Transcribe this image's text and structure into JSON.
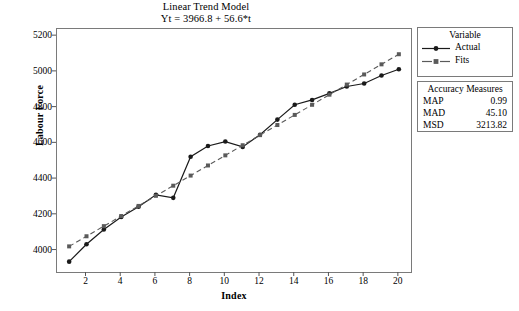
{
  "chart_data": {
    "type": "line",
    "title": "Linear Trend Model",
    "subtitle": "Yt = 3966.8 + 56.6*t",
    "xlabel": "Index",
    "ylabel": "Labour Force",
    "xlim": [
      0.3,
      20.7
    ],
    "ylim": [
      3880,
      5240
    ],
    "xticks": [
      2,
      4,
      6,
      8,
      10,
      12,
      14,
      16,
      18,
      20
    ],
    "yticks": [
      4000,
      4200,
      4400,
      4600,
      4800,
      5000,
      5200
    ],
    "grid": false,
    "legend_position": "right",
    "legend_title": "Variable",
    "x": [
      1,
      2,
      3,
      4,
      5,
      6,
      7,
      8,
      9,
      10,
      11,
      12,
      13,
      14,
      15,
      16,
      17,
      18,
      19,
      20
    ],
    "series": [
      {
        "name": "Actual",
        "style": "solid",
        "marker": "circle",
        "color": "#1a1a1a",
        "values": [
          3938,
          4035,
          4118,
          4188,
          4245,
          4312,
          4295,
          4525,
          4585,
          4610,
          4580,
          4648,
          4733,
          4816,
          4843,
          4880,
          4918,
          4935,
          4980,
          5015
        ]
      },
      {
        "name": "Fits",
        "style": "dashed",
        "marker": "square",
        "color": "#5a5a5a",
        "values": [
          4023.4,
          4080.0,
          4136.6,
          4193.2,
          4249.8,
          4306.4,
          4363.0,
          4419.6,
          4476.2,
          4532.8,
          4589.4,
          4646.0,
          4702.6,
          4759.2,
          4815.8,
          4872.4,
          4929.0,
          4985.6,
          5042.2,
          5098.8
        ]
      }
    ],
    "annotations": {
      "accuracy_title": "Accuracy Measures",
      "accuracy": [
        {
          "label": "MAP",
          "value": "0.99"
        },
        {
          "label": "MAD",
          "value": "45.10"
        },
        {
          "label": "MSD",
          "value": "3213.82"
        }
      ]
    }
  }
}
